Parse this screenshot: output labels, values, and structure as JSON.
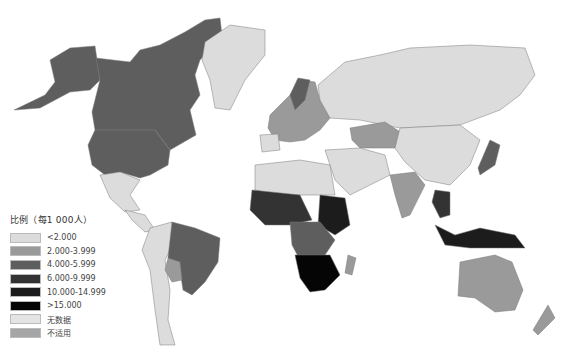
{
  "legend": {
    "title": "比例（每1 000人）",
    "items": [
      {
        "label": "<2.000",
        "color": "#dcdcdc"
      },
      {
        "label": "2.000-3.999",
        "color": "#9a9a9a"
      },
      {
        "label": "4.000-5.999",
        "color": "#5e5e5e"
      },
      {
        "label": "6.000-9.999",
        "color": "#333333"
      },
      {
        "label": "10.000-14.999",
        "color": "#1c1c1c"
      },
      {
        "label": ">15.000",
        "color": "#050505"
      },
      {
        "label": "无数据",
        "color": "#e4e4e4"
      },
      {
        "label": "不适用",
        "color": "#a6a6a6"
      }
    ]
  },
  "map": {
    "type": "choropleth-world",
    "regions": [
      {
        "name": "North America (USA, Canada, Alaska)",
        "class": "4.000-5.999"
      },
      {
        "name": "Greenland",
        "class": "<2.000"
      },
      {
        "name": "Mexico & Central America",
        "class": "<2.000"
      },
      {
        "name": "Brazil",
        "class": "4.000-5.999"
      },
      {
        "name": "Bolivia",
        "class": "2.000-3.999"
      },
      {
        "name": "Rest of South America",
        "class": "<2.000"
      },
      {
        "name": "Russia",
        "class": "<2.000"
      },
      {
        "name": "Kazakhstan",
        "class": "2.000-3.999"
      },
      {
        "name": "China",
        "class": "<2.000"
      },
      {
        "name": "India",
        "class": "2.000-3.999"
      },
      {
        "name": "Japan",
        "class": "4.000-5.999"
      },
      {
        "name": "Southeast Asia",
        "class": "6.000-9.999"
      },
      {
        "name": "Indonesia / Papua New Guinea",
        "class": "10.000-14.999"
      },
      {
        "name": "Australia",
        "class": "2.000-3.999"
      },
      {
        "name": "New Zealand",
        "class": "2.000-3.999"
      },
      {
        "name": "North Africa",
        "class": "<2.000"
      },
      {
        "name": "West/Central Africa",
        "class": "6.000-9.999"
      },
      {
        "name": "Southern Africa",
        "class": ">15.000"
      },
      {
        "name": "Madagascar",
        "class": "2.000-3.999"
      },
      {
        "name": "Europe",
        "class": "2.000-3.999"
      }
    ]
  }
}
